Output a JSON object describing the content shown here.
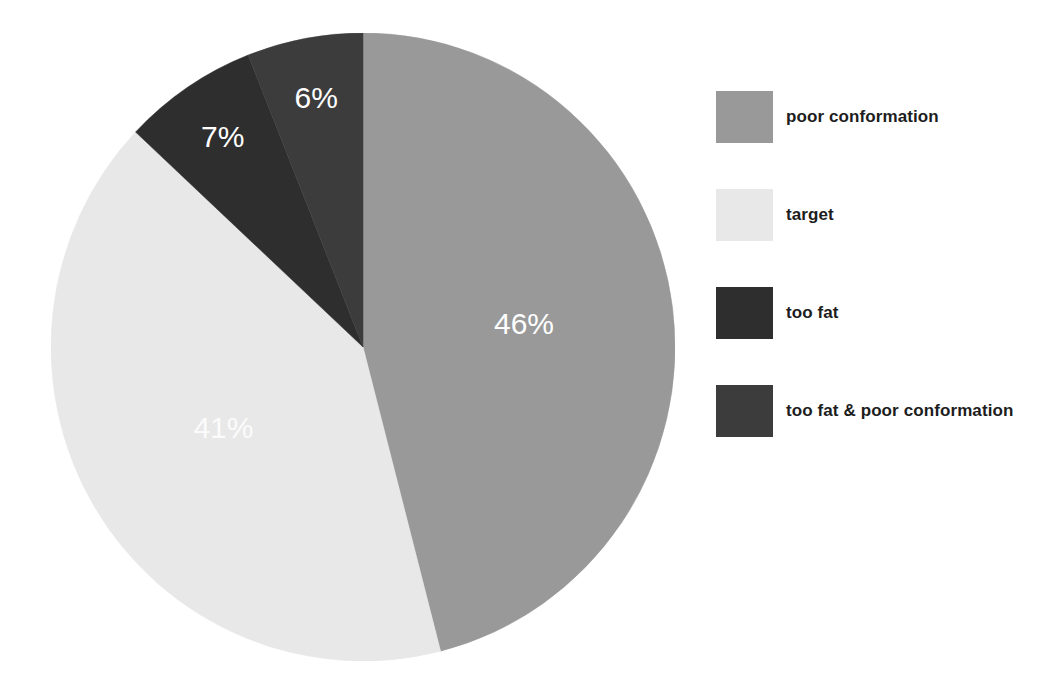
{
  "chart_data": {
    "type": "pie",
    "title": "",
    "subtitle": "",
    "xlabel": "",
    "ylabel": "",
    "grid": false,
    "legend_position": "right",
    "start_angle_deg": 0,
    "direction": "clockwise",
    "categories": [
      "poor conformation",
      "target",
      "too fat",
      "too fat & poor conformation"
    ],
    "values": [
      46,
      41,
      7,
      6
    ],
    "value_unit": "%",
    "data_labels": [
      "46%",
      "41%",
      "7%",
      "6%"
    ],
    "colors": [
      "#999999",
      "#e8e8e8",
      "#2e2e2e",
      "#3c3c3c"
    ],
    "label_text_colors": [
      "#ffffff",
      "#fbfbfb",
      "#ffffff",
      "#ffffff"
    ],
    "slices": [
      {
        "label": "poor conformation",
        "value": 46,
        "data_label": "46%",
        "color": "#999999",
        "label_color": "#ffffff"
      },
      {
        "label": "target",
        "value": 41,
        "data_label": "41%",
        "color": "#e8e8e8",
        "label_color": "#fbfbfb"
      },
      {
        "label": "too fat",
        "value": 7,
        "data_label": "7%",
        "color": "#2e2e2e",
        "label_color": "#ffffff"
      },
      {
        "label": "too fat & poor conformation",
        "value": 6,
        "data_label": "6%",
        "color": "#3c3c3c",
        "label_color": "#ffffff"
      }
    ]
  },
  "legend": {
    "items": [
      {
        "label": "poor conformation",
        "color": "#999999"
      },
      {
        "label": "target",
        "color": "#e8e8e8"
      },
      {
        "label": "too fat",
        "color": "#2e2e2e"
      },
      {
        "label": "too fat & poor conformation",
        "color": "#3c3c3c"
      }
    ]
  },
  "labels": {
    "slice_1": "46%",
    "slice_2": "41%",
    "slice_3": "7%",
    "slice_4": "6%"
  }
}
